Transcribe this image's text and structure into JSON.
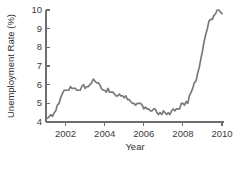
{
  "chart_data": {
    "type": "line",
    "title": "",
    "xlabel": "Year",
    "ylabel": "Unemployment Rate (%)",
    "xlim": [
      2001.0,
      2010.1
    ],
    "ylim": [
      4,
      10
    ],
    "xticks": [
      2002,
      2004,
      2006,
      2008,
      2010
    ],
    "xtick_labels": [
      "2002",
      "2004",
      "2006",
      "2008",
      "2010"
    ],
    "yticks": [
      4,
      5,
      6,
      7,
      8,
      9,
      10
    ],
    "ytick_labels": [
      "4",
      "5",
      "6",
      "7",
      "8",
      "9",
      "10"
    ],
    "grid": false,
    "legend": false,
    "line_color": "#7a7a7a",
    "axis_color": "#6e6e6e",
    "background_color": "#ffffff",
    "series": [
      {
        "name": "Unemployment Rate",
        "x": [
          2001.0,
          2001.08,
          2001.17,
          2001.25,
          2001.33,
          2001.42,
          2001.5,
          2001.58,
          2001.67,
          2001.75,
          2001.83,
          2001.92,
          2002.0,
          2002.08,
          2002.17,
          2002.25,
          2002.33,
          2002.42,
          2002.5,
          2002.58,
          2002.67,
          2002.75,
          2002.83,
          2002.92,
          2003.0,
          2003.08,
          2003.17,
          2003.25,
          2003.33,
          2003.42,
          2003.5,
          2003.58,
          2003.67,
          2003.75,
          2003.83,
          2003.92,
          2004.0,
          2004.08,
          2004.17,
          2004.25,
          2004.33,
          2004.42,
          2004.5,
          2004.58,
          2004.67,
          2004.75,
          2004.83,
          2004.92,
          2005.0,
          2005.08,
          2005.17,
          2005.25,
          2005.33,
          2005.42,
          2005.5,
          2005.58,
          2005.67,
          2005.75,
          2005.83,
          2005.92,
          2006.0,
          2006.08,
          2006.17,
          2006.25,
          2006.33,
          2006.42,
          2006.5,
          2006.58,
          2006.67,
          2006.75,
          2006.83,
          2006.92,
          2007.0,
          2007.08,
          2007.17,
          2007.25,
          2007.33,
          2007.42,
          2007.5,
          2007.58,
          2007.67,
          2007.75,
          2007.83,
          2007.92,
          2008.0,
          2008.08,
          2008.17,
          2008.25,
          2008.33,
          2008.42,
          2008.5,
          2008.58,
          2008.67,
          2008.75,
          2008.83,
          2008.92,
          2009.0,
          2009.08,
          2009.17,
          2009.25,
          2009.33,
          2009.42,
          2009.5,
          2009.58,
          2009.67,
          2009.75,
          2009.83,
          2009.92,
          2010.0
        ],
        "values": [
          4.2,
          4.2,
          4.3,
          4.4,
          4.3,
          4.5,
          4.6,
          4.9,
          5.0,
          5.3,
          5.5,
          5.7,
          5.7,
          5.7,
          5.7,
          5.9,
          5.8,
          5.8,
          5.8,
          5.7,
          5.7,
          5.7,
          5.9,
          6.0,
          5.8,
          5.9,
          5.9,
          6.0,
          6.1,
          6.3,
          6.2,
          6.1,
          6.1,
          6.0,
          5.8,
          5.7,
          5.7,
          5.6,
          5.8,
          5.6,
          5.6,
          5.6,
          5.5,
          5.4,
          5.4,
          5.5,
          5.4,
          5.4,
          5.3,
          5.4,
          5.2,
          5.2,
          5.1,
          5.0,
          5.0,
          4.9,
          5.0,
          5.0,
          5.0,
          4.9,
          4.7,
          4.8,
          4.7,
          4.7,
          4.6,
          4.6,
          4.7,
          4.7,
          4.5,
          4.4,
          4.5,
          4.4,
          4.6,
          4.5,
          4.4,
          4.5,
          4.4,
          4.6,
          4.7,
          4.6,
          4.7,
          4.7,
          4.7,
          5.0,
          5.0,
          4.9,
          5.1,
          5.0,
          5.4,
          5.6,
          5.8,
          6.1,
          6.2,
          6.6,
          6.9,
          7.4,
          7.8,
          8.3,
          8.7,
          9.0,
          9.4,
          9.5,
          9.5,
          9.7,
          9.8,
          10.0,
          10.0,
          9.9,
          9.8
        ],
        "color": "#7a7a7a"
      }
    ]
  }
}
